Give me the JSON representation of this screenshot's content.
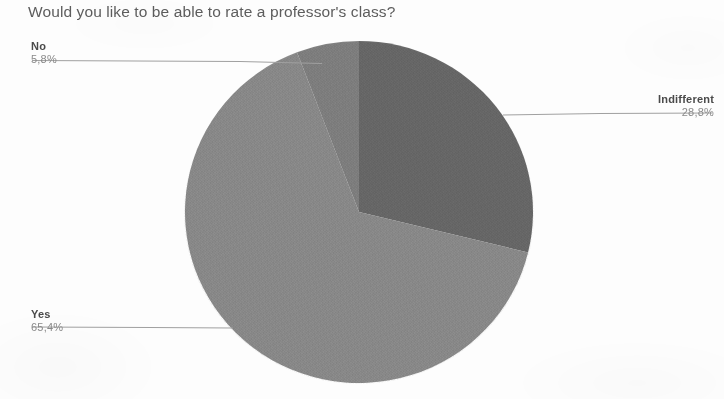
{
  "chart_data": {
    "type": "pie",
    "title": "Would you like to be able to rate a professor's class?",
    "categories": [
      "Yes",
      "Indifferent",
      "No"
    ],
    "values": [
      65.4,
      28.8,
      5.8
    ],
    "value_labels": [
      "65,4%",
      "28,8%",
      "5,8%"
    ],
    "colors": [
      "#8d8d8d",
      "#6a6a6a",
      "#828282"
    ],
    "decimal_separator": ",",
    "unit": "%",
    "legend": "callout-labels",
    "grid": false,
    "start_angle_deg": 0,
    "direction": "clockwise",
    "slices": [
      {
        "label": "Indifferent",
        "value": 28.8,
        "value_label": "28,8%",
        "color": "#6a6a6a",
        "start_deg": 0,
        "end_deg": 103.68
      },
      {
        "label": "Yes",
        "value": 65.4,
        "value_label": "65,4%",
        "color": "#8d8d8d",
        "start_deg": 103.68,
        "end_deg": 339.12
      },
      {
        "label": "No",
        "value": 5.8,
        "value_label": "5,8%",
        "color": "#828282",
        "start_deg": 339.12,
        "end_deg": 360
      }
    ]
  },
  "title": {
    "text": "Would you like to be able to rate a professor's class?"
  },
  "callouts": {
    "no": {
      "label": "No",
      "percent": "5,8%"
    },
    "yes": {
      "label": "Yes",
      "percent": "65,4%"
    },
    "indifferent": {
      "label": "Indifferent",
      "percent": "28,8%"
    }
  },
  "theme": {
    "background": "#fdfdfd",
    "title_color": "#5d5d5d",
    "label_color": "#4a4a4a",
    "percent_color": "#8a8a8a",
    "leader_color": "#9a9a9a"
  }
}
